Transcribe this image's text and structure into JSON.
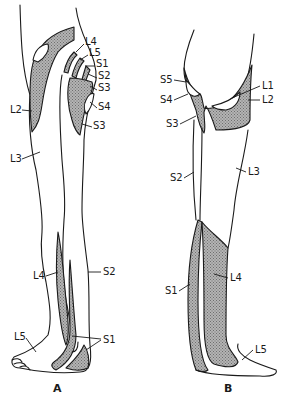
{
  "figure": {
    "type": "dermatome-map",
    "colors": {
      "line": "#1a1a1a",
      "shade": "#9a9a9a",
      "background": "#ffffff"
    },
    "panels": [
      {
        "id": "A",
        "label": "A",
        "view": "anterior",
        "labels": [
          {
            "text": "L4",
            "x": 85,
            "y": 45
          },
          {
            "text": "L5",
            "x": 89,
            "y": 56
          },
          {
            "text": "S1",
            "x": 96,
            "y": 67
          },
          {
            "text": "S2",
            "x": 98,
            "y": 79
          },
          {
            "text": "S3",
            "x": 98,
            "y": 91
          },
          {
            "text": "L2",
            "x": 10,
            "y": 113
          },
          {
            "text": "S4",
            "x": 98,
            "y": 110
          },
          {
            "text": "S3",
            "x": 93,
            "y": 129
          },
          {
            "text": "L3",
            "x": 10,
            "y": 162
          },
          {
            "text": "L4",
            "x": 33,
            "y": 279
          },
          {
            "text": "S2",
            "x": 103,
            "y": 275
          },
          {
            "text": "L5",
            "x": 14,
            "y": 340
          },
          {
            "text": "S1",
            "x": 103,
            "y": 343
          }
        ]
      },
      {
        "id": "B",
        "label": "B",
        "view": "posterior",
        "labels": [
          {
            "text": "S5",
            "x": 160,
            "y": 83
          },
          {
            "text": "L1",
            "x": 262,
            "y": 89
          },
          {
            "text": "S4",
            "x": 160,
            "y": 103
          },
          {
            "text": "L2",
            "x": 262,
            "y": 103
          },
          {
            "text": "S3",
            "x": 166,
            "y": 127
          },
          {
            "text": "S2",
            "x": 170,
            "y": 181
          },
          {
            "text": "L3",
            "x": 248,
            "y": 175
          },
          {
            "text": "S1",
            "x": 165,
            "y": 294
          },
          {
            "text": "L4",
            "x": 230,
            "y": 281
          },
          {
            "text": "L5",
            "x": 255,
            "y": 353
          }
        ]
      }
    ]
  }
}
